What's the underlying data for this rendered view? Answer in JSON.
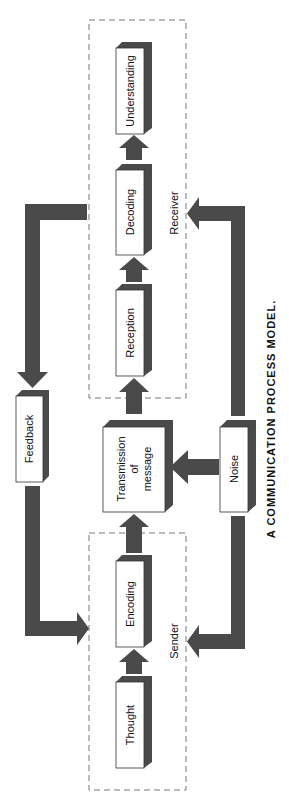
{
  "diagram": {
    "title": "A COMMUNICATION PROCESS MODEL.",
    "orientation": "rotated 90deg counter-clockwise (text reads bottom-to-top)",
    "colors": {
      "arrow": "#4a4a4a",
      "box_shadow": "#4a4a4a",
      "box_fill": "#ffffff",
      "dashed_border": "#777777",
      "text": "#111111"
    },
    "groups": {
      "receiver": {
        "label": "Receiver"
      },
      "sender": {
        "label": "Sender"
      }
    },
    "nodes": {
      "understanding": {
        "label": "Understanding"
      },
      "decoding": {
        "label": "Decoding"
      },
      "reception": {
        "label": "Reception"
      },
      "transmission": {
        "line1": "Transmission",
        "line2": "of",
        "line3": "message"
      },
      "noise": {
        "label": "Noise"
      },
      "feedback": {
        "label": "Feedback"
      },
      "encoding": {
        "label": "Encoding"
      },
      "thought": {
        "label": "Thought"
      }
    },
    "edges": [
      {
        "from": "Thought",
        "to": "Encoding"
      },
      {
        "from": "Encoding",
        "to": "Transmission of message"
      },
      {
        "from": "Transmission of message",
        "to": "Reception"
      },
      {
        "from": "Reception",
        "to": "Decoding"
      },
      {
        "from": "Decoding",
        "to": "Understanding"
      },
      {
        "from": "Noise",
        "to": "Transmission of message"
      },
      {
        "from": "Noise",
        "to": "Receiver"
      },
      {
        "from": "Noise",
        "to": "Sender"
      },
      {
        "from": "Receiver",
        "to": "Feedback"
      },
      {
        "from": "Feedback",
        "to": "Sender"
      }
    ]
  }
}
